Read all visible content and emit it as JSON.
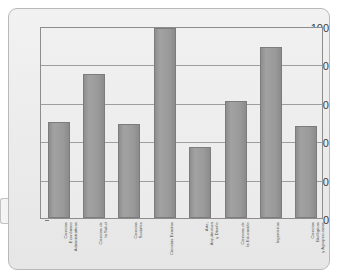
{
  "chart_data": {
    "type": "bar",
    "title": "",
    "subtitle": "",
    "xlabel": "",
    "ylabel": "",
    "ylim": [
      0,
      100
    ],
    "yticks": [
      0,
      20,
      40,
      60,
      80,
      100
    ],
    "grid": true,
    "legend": false,
    "bar_color": "#9a9a9a",
    "bar_border_color": "#7c7c7c",
    "plot_background": "#ededed",
    "frame_background": "#eeeeee",
    "categories": [
      "Ciencias\nEconómico\nAdministrativas",
      "Ciencias de\nla Salud",
      "Ciencias\nSociales",
      "Ciencias Exactas",
      "Arte,\nArquitectura\ny Diseño",
      "Ciencias de\nla Educación",
      "Ingenierías",
      "Ciencias\nBiológicas\ny Agropecuarias"
    ],
    "values": [
      50,
      75,
      49,
      99,
      37,
      61,
      89,
      48
    ],
    "series": [
      {
        "name": "Porcentaje",
        "values": [
          50,
          75,
          49,
          99,
          37,
          61,
          89,
          48
        ]
      }
    ]
  },
  "axis": {
    "y_tick_labels": [
      "100",
      "80",
      "60",
      "40",
      "20",
      "0"
    ]
  }
}
